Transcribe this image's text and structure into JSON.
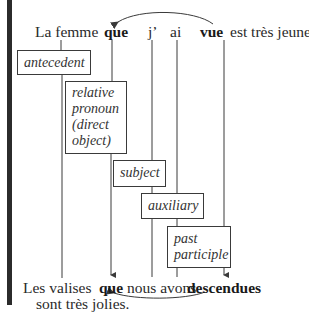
{
  "top_sentence": {
    "words": [
      "La femme",
      "que",
      "j’",
      "ai",
      "vue",
      "est très jeune."
    ]
  },
  "bottom_sentence": {
    "line1": [
      "Les valises",
      "que",
      "nous avons",
      "descendues"
    ],
    "line2": "sont très jolies."
  },
  "labels": {
    "antecedent": "antecedent",
    "relative_pronoun": [
      "relative",
      "pronoun",
      "(direct",
      "object)"
    ],
    "subject": "subject",
    "auxiliary": "auxiliary",
    "past_participle": [
      "past",
      "participle"
    ]
  },
  "colors": {
    "line": "#3a3a3a",
    "bar": "#2b2b2b",
    "text": "#2a2a2a"
  }
}
